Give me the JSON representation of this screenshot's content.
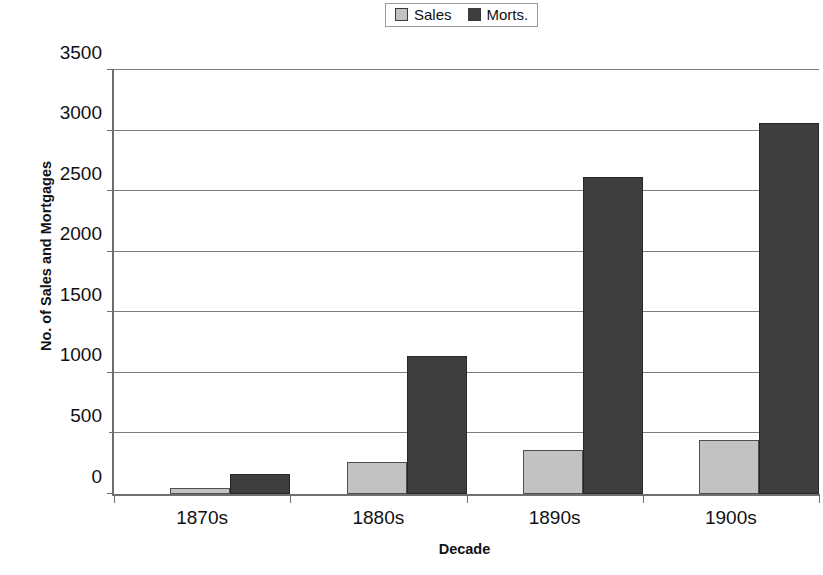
{
  "chart_data": {
    "type": "bar",
    "title": "",
    "xlabel": "Decade",
    "ylabel": "No. of Sales and Mortgages",
    "categories": [
      "1870s",
      "1880s",
      "1890s",
      "1900s"
    ],
    "series": [
      {
        "name": "Sales",
        "color": "#c2c2c2",
        "values": [
          50,
          265,
          365,
          450
        ]
      },
      {
        "name": "Morts.",
        "color": "#3e3e3e",
        "values": [
          165,
          1140,
          2620,
          3060
        ]
      }
    ],
    "ylim": [
      0,
      3500
    ],
    "yticks": [
      0,
      500,
      1000,
      1500,
      2000,
      2500,
      3000,
      3500
    ],
    "ytick_labels": [
      "0",
      "500",
      "1000",
      "1500",
      "2000",
      "2500",
      "3000",
      "3500"
    ],
    "grid": true,
    "legend_position": "top-center"
  },
  "legend": {
    "entries": [
      {
        "label": "Sales",
        "swatch": "light-gray-swatch-icon"
      },
      {
        "label": "Morts.",
        "swatch": "dark-gray-swatch-icon"
      }
    ]
  }
}
